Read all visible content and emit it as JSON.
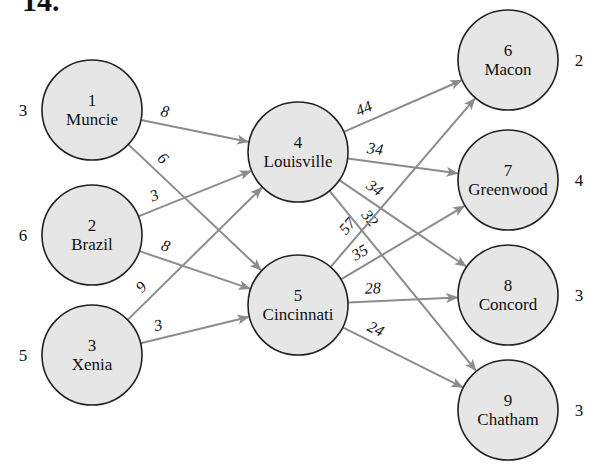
{
  "heading": "14.",
  "colors": {
    "node_fill": "#e6e6e6",
    "node_stroke": "#222222",
    "edge": "#8c8c8c",
    "text": "#111111"
  },
  "nodes": [
    {
      "id": "1",
      "num": "1",
      "name": "Muncie",
      "supply": "3",
      "x": 92,
      "y": 110,
      "side": "left"
    },
    {
      "id": "2",
      "num": "2",
      "name": "Brazil",
      "supply": "6",
      "x": 92,
      "y": 235,
      "side": "left"
    },
    {
      "id": "3",
      "num": "3",
      "name": "Xenia",
      "supply": "5",
      "x": 92,
      "y": 355,
      "side": "left"
    },
    {
      "id": "4",
      "num": "4",
      "name": "Louisville",
      "supply": "",
      "x": 298,
      "y": 152,
      "side": "none"
    },
    {
      "id": "5",
      "num": "5",
      "name": "Cincinnati",
      "supply": "",
      "x": 298,
      "y": 305,
      "side": "none"
    },
    {
      "id": "6",
      "num": "6",
      "name": "Macon",
      "supply": "2",
      "x": 508,
      "y": 60,
      "side": "right"
    },
    {
      "id": "7",
      "num": "7",
      "name": "Greenwood",
      "supply": "4",
      "x": 508,
      "y": 180,
      "side": "right"
    },
    {
      "id": "8",
      "num": "8",
      "name": "Concord",
      "supply": "3",
      "x": 508,
      "y": 295,
      "side": "right"
    },
    {
      "id": "9",
      "num": "9",
      "name": "Chatham",
      "supply": "3",
      "x": 508,
      "y": 410,
      "side": "right"
    }
  ],
  "edges": [
    {
      "from": "1",
      "to": "4",
      "cost": "8"
    },
    {
      "from": "1",
      "to": "5",
      "cost": "6"
    },
    {
      "from": "2",
      "to": "4",
      "cost": "3"
    },
    {
      "from": "2",
      "to": "5",
      "cost": "8"
    },
    {
      "from": "3",
      "to": "4",
      "cost": "9"
    },
    {
      "from": "3",
      "to": "5",
      "cost": "3"
    },
    {
      "from": "4",
      "to": "6",
      "cost": "44"
    },
    {
      "from": "4",
      "to": "7",
      "cost": "34"
    },
    {
      "from": "4",
      "to": "8",
      "cost": "34"
    },
    {
      "from": "4",
      "to": "9",
      "cost": "32"
    },
    {
      "from": "5",
      "to": "6",
      "cost": "57"
    },
    {
      "from": "5",
      "to": "7",
      "cost": "35"
    },
    {
      "from": "5",
      "to": "8",
      "cost": "28"
    },
    {
      "from": "5",
      "to": "9",
      "cost": "24"
    }
  ]
}
